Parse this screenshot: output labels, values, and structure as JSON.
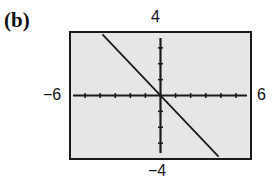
{
  "panel_label": "(b)",
  "window": {
    "xmin_label": "−6",
    "xmax_label": "6",
    "ymax_label": "4",
    "ymin_label": "−4"
  },
  "colors": {
    "screen_bg": "#e6e6e6",
    "frame": "#1a1a1a",
    "line": "#1a1a1a"
  },
  "chart_data": {
    "type": "line",
    "title": "(b)",
    "xlabel": "",
    "ylabel": "",
    "xlim": [
      -6,
      6
    ],
    "ylim": [
      -4,
      4
    ],
    "xscale_tick": 1,
    "yscale_tick": 1,
    "grid": false,
    "tick_labels": {
      "x": [
        "-6",
        "6"
      ],
      "y": [
        "-4",
        "4"
      ]
    },
    "series": [
      {
        "name": "y = -x",
        "x": [
          -3.85,
          3.85
        ],
        "y": [
          3.85,
          -3.85
        ]
      }
    ]
  }
}
